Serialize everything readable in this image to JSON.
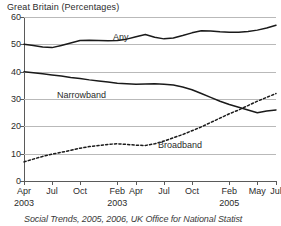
{
  "title": "Great Britain (Percentages)",
  "source": "Social Trends, 2005, 2006, UK Office for National Statist",
  "series_labels": {
    "any": "Any",
    "narrowband": "Narrowband",
    "broadband": "Broadband"
  },
  "chart_data": {
    "type": "line",
    "title": "Great Britain (Percentages)",
    "xlabel": "",
    "ylabel": "",
    "ylim": [
      0,
      60
    ],
    "yticks": [
      0,
      10,
      20,
      30,
      40,
      50,
      60
    ],
    "ytick_labels": [
      "0",
      "10",
      "20",
      "30",
      "40",
      "50",
      "60"
    ],
    "grid": true,
    "legend": "inline-labels",
    "x": [
      "Apr 2003",
      "May 2003",
      "Jun 2003",
      "Jul 2003",
      "Aug 2003",
      "Sep 2003",
      "Oct 2003",
      "Nov 2003",
      "Dec 2003",
      "Jan 2004",
      "Feb 2004",
      "Mar 2004",
      "Apr 2004",
      "May 2004",
      "Jun 2004",
      "Jul 2004",
      "Aug 2004",
      "Sep 2004",
      "Oct 2004",
      "Nov 2004",
      "Dec 2004",
      "Jan 2005",
      "Feb 2005",
      "Mar 2005",
      "Apr 2005",
      "May 2005",
      "Jun 2005",
      "Jul 2005"
    ],
    "xtick_labels": [
      "Apr",
      "Jul",
      "Oct",
      "Feb",
      "Apr",
      "Jul",
      "Oct",
      "Feb",
      "May",
      "Jul"
    ],
    "xtick_positions": [
      0,
      3,
      6,
      10,
      12,
      15,
      18,
      22,
      25,
      27
    ],
    "year_labels": [
      {
        "label": "2003",
        "at": 0
      },
      {
        "label": "2003",
        "at": 10
      },
      {
        "label": "2005",
        "at": 22
      }
    ],
    "series": [
      {
        "name": "Any",
        "style": "solid",
        "color": "#1a1a1a",
        "values": [
          50.0,
          49.6,
          49.0,
          48.8,
          49.6,
          50.5,
          51.4,
          51.5,
          51.4,
          51.3,
          51.4,
          51.9,
          52.8,
          53.6,
          52.6,
          52.0,
          52.3,
          53.2,
          54.2,
          55.0,
          54.9,
          54.6,
          54.4,
          54.4,
          54.7,
          55.2,
          56.0,
          57.0
        ]
      },
      {
        "name": "Narrowband",
        "style": "solid",
        "color": "#1a1a1a",
        "values": [
          40.0,
          39.6,
          39.2,
          38.8,
          38.4,
          37.9,
          37.5,
          37.0,
          36.6,
          36.2,
          35.8,
          35.6,
          35.4,
          35.5,
          35.6,
          35.4,
          35.1,
          34.4,
          33.4,
          32.0,
          30.6,
          29.2,
          28.0,
          27.0,
          26.0,
          25.0,
          25.6,
          26.0
        ]
      },
      {
        "name": "Broadband",
        "style": "dotted",
        "color": "#1a1a1a",
        "values": [
          7.0,
          8.0,
          9.0,
          9.8,
          10.5,
          11.2,
          12.0,
          12.6,
          13.0,
          13.4,
          13.6,
          13.4,
          13.1,
          13.0,
          13.6,
          14.6,
          15.8,
          17.0,
          18.4,
          19.8,
          21.4,
          23.0,
          24.6,
          26.0,
          27.6,
          29.2,
          30.6,
          32.0
        ]
      }
    ]
  }
}
